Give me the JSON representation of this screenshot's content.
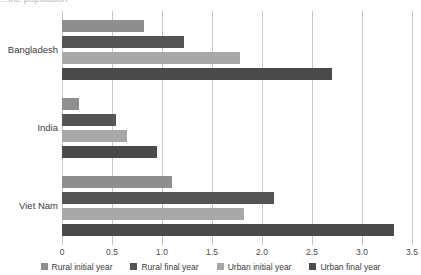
{
  "chart_data": {
    "type": "bar",
    "orientation": "horizontal",
    "title": "...the population",
    "subtitle": "",
    "xlabel": "",
    "ylabel": "",
    "categories": [
      "Bangladesh",
      "India",
      "Viet Nam"
    ],
    "series": [
      {
        "name": "Rural initial year",
        "color": "#8e8e8e",
        "values": [
          0.82,
          0.17,
          1.1
        ]
      },
      {
        "name": "Rural final year",
        "color": "#545454",
        "values": [
          1.22,
          0.54,
          2.12
        ]
      },
      {
        "name": "Urban initial year",
        "color": "#a8a8a8",
        "values": [
          1.78,
          0.65,
          1.82
        ]
      },
      {
        "name": "Urban final year",
        "color": "#4a4a4a",
        "values": [
          2.7,
          0.95,
          3.32
        ]
      }
    ],
    "xlim": [
      0,
      3.5
    ],
    "xticks": [
      0,
      0.5,
      1.0,
      1.5,
      2.0,
      2.5,
      3.0,
      3.5
    ],
    "xtick_labels": [
      "0",
      "0.5",
      "1.0",
      "1.5",
      "2.0",
      "2.5",
      "3.0",
      "3.5"
    ],
    "grid": true,
    "grid_axis": "x",
    "grid_color": "#c9c9c9",
    "legend_position": "bottom",
    "background": "#ffffff"
  }
}
